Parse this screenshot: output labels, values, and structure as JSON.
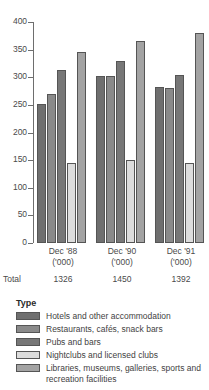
{
  "chart_data": {
    "type": "bar",
    "title": "",
    "subtitle": "",
    "xlabel": "",
    "ylabel": "",
    "ylim": [
      0,
      400
    ],
    "y_ticks": [
      0,
      50,
      100,
      150,
      200,
      250,
      300,
      350,
      400
    ],
    "grid": false,
    "legend_position": "below",
    "legend_title": "Type",
    "categories": [
      "Dec '88",
      "Dec '90",
      "Dec '91"
    ],
    "category_sublabels": [
      "('000)",
      "('000)",
      "('000)"
    ],
    "series": [
      {
        "name": "Hotels and other accommodation",
        "color": "#6f6f6f",
        "values": [
          252,
          302,
          283
        ]
      },
      {
        "name": "Restaurants, cafés, snack bars",
        "color": "#8a8a8a",
        "values": [
          270,
          303,
          281
        ]
      },
      {
        "name": "Pubs and bars",
        "color": "#777777",
        "values": [
          313,
          329,
          305
        ]
      },
      {
        "name": "Nightclubs and licensed clubs",
        "color": "#dcdcdc",
        "values": [
          145,
          151,
          145
        ]
      },
      {
        "name": "Libraries, museums, galleries, sports and recreation facilities",
        "color": "#a3a3a3",
        "values": [
          346,
          365,
          380
        ]
      }
    ],
    "totals_label": "Total",
    "totals": [
      "1326",
      "1450",
      "1392"
    ]
  }
}
